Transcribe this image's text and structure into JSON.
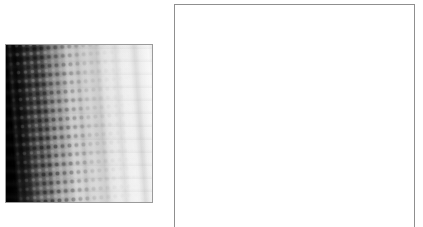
{
  "document": {
    "title": "Image Viewer",
    "background_color": "#ffffff",
    "width": 423,
    "height": 227
  },
  "image_panel": {
    "name": "grayscale-image",
    "alt_text": "",
    "border_color": "#9a9a9a",
    "bounds": {
      "x": 5,
      "y": 44,
      "width": 148,
      "height": 159
    },
    "appearance": {
      "type": "grayscale-gradient-image",
      "gradient_direction": "left-to-right",
      "darkest_value": "#000000",
      "brightest_value": "#fafafa",
      "band_tilt_degrees": -4.2,
      "texture": "periodic-dot-checkerboard"
    }
  },
  "empty_panel": {
    "name": "empty-drawing-area",
    "content": "",
    "border_color": "#8f8f8f",
    "fill_color": "#ffffff",
    "bounds": {
      "x": 174,
      "y": 4,
      "width": 241,
      "height": 232
    },
    "bottom_edge_cropped": true
  }
}
